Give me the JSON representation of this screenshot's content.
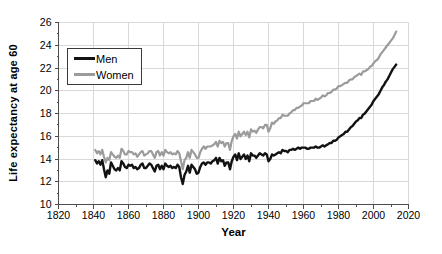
{
  "chart_data": {
    "type": "line",
    "title": "",
    "xlabel": "Year",
    "ylabel": "Life expectancy at age 60",
    "xlim": [
      1820,
      2020
    ],
    "ylim": [
      10,
      26
    ],
    "xticks": [
      1820,
      1840,
      1860,
      1880,
      1900,
      1920,
      1940,
      1960,
      1980,
      2000,
      2020
    ],
    "xminor_ticks": [
      1830,
      1850,
      1870,
      1890,
      1910,
      1930,
      1950,
      1970,
      1990,
      2010
    ],
    "yticks": [
      10,
      12,
      14,
      16,
      18,
      20,
      22,
      24,
      26
    ],
    "yminor_ticks": [
      11,
      13,
      15,
      17,
      19,
      21,
      23,
      25
    ],
    "grid": true,
    "legend_position": "upper-left-inside",
    "x_start": 1841,
    "x_end": 2013,
    "axis_color": "#4d4d4d",
    "grid_color": "#d9d9d9",
    "tick_label_color": "#000000",
    "series": [
      {
        "name": "Men",
        "color": "#121212",
        "values": [
          13.9,
          13.6,
          13.8,
          13.5,
          13.9,
          13.1,
          12.4,
          13.0,
          12.7,
          13.7,
          13.4,
          13.1,
          13.0,
          13.2,
          13.0,
          13.8,
          13.6,
          13.3,
          13.2,
          13.5,
          13.4,
          13.5,
          13.2,
          13.3,
          13.1,
          13.2,
          13.5,
          13.6,
          13.2,
          13.2,
          13.4,
          13.6,
          13.5,
          13.2,
          12.9,
          13.4,
          13.5,
          13.1,
          13.4,
          13.1,
          13.6,
          13.4,
          13.3,
          13.4,
          13.2,
          13.3,
          13.2,
          13.5,
          13.3,
          12.4,
          11.8,
          12.6,
          12.9,
          13.4,
          12.8,
          13.5,
          13.3,
          13.1,
          12.7,
          12.8,
          13.3,
          13.6,
          13.7,
          13.5,
          13.7,
          13.7,
          13.6,
          13.8,
          13.9,
          14.1,
          13.6,
          14.1,
          13.8,
          13.9,
          13.4,
          13.7,
          13.7,
          13.1,
          13.8,
          14.2,
          14.4,
          13.9,
          14.5,
          14.0,
          14.2,
          14.4,
          14.0,
          14.3,
          13.8,
          14.5,
          14.3,
          14.3,
          14.1,
          14.3,
          14.5,
          14.4,
          14.3,
          14.5,
          14.4,
          13.8,
          14.0,
          14.4,
          14.3,
          14.4,
          14.5,
          14.6,
          14.5,
          14.8,
          14.7,
          14.7,
          14.6,
          14.8,
          14.8,
          14.9,
          14.8,
          14.9,
          15.0,
          14.9,
          15.0,
          15.0,
          15.0,
          14.9,
          14.9,
          15.0,
          15.0,
          15.0,
          15.1,
          15.0,
          15.0,
          15.1,
          15.2,
          15.1,
          15.2,
          15.3,
          15.4,
          15.4,
          15.6,
          15.6,
          15.7,
          15.9,
          16.0,
          16.1,
          16.2,
          16.4,
          16.4,
          16.6,
          16.8,
          16.9,
          17.1,
          17.3,
          17.4,
          17.6,
          17.6,
          17.9,
          18.0,
          18.2,
          18.4,
          18.6,
          18.8,
          19.1,
          19.3,
          19.5,
          19.7,
          20.0,
          20.3,
          20.5,
          20.8,
          21.0,
          21.3,
          21.6,
          21.9,
          22.1,
          22.3
        ]
      },
      {
        "name": "Women",
        "color": "#9b9b9b",
        "values": [
          14.8,
          14.5,
          14.7,
          14.4,
          14.8,
          14.2,
          13.7,
          14.1,
          13.9,
          14.6,
          14.4,
          14.2,
          14.1,
          14.3,
          14.1,
          14.9,
          14.7,
          14.4,
          14.4,
          14.7,
          14.6,
          14.6,
          14.4,
          14.5,
          14.2,
          14.4,
          14.6,
          14.7,
          14.3,
          14.4,
          14.5,
          14.7,
          14.7,
          14.4,
          14.1,
          14.6,
          14.7,
          14.3,
          14.6,
          14.3,
          14.8,
          14.6,
          14.5,
          14.6,
          14.4,
          14.5,
          14.4,
          14.7,
          14.5,
          13.8,
          13.1,
          13.9,
          14.1,
          14.6,
          14.1,
          14.8,
          14.6,
          14.4,
          14.1,
          14.1,
          14.6,
          14.9,
          15.1,
          14.9,
          15.1,
          15.1,
          15.1,
          15.2,
          15.3,
          15.5,
          15.1,
          15.6,
          15.4,
          15.5,
          15.1,
          15.4,
          15.4,
          14.8,
          15.6,
          16.0,
          16.2,
          15.8,
          16.4,
          16.0,
          16.2,
          16.4,
          16.1,
          16.4,
          15.9,
          16.6,
          16.4,
          16.5,
          16.3,
          16.6,
          16.8,
          16.8,
          16.7,
          17.0,
          17.0,
          16.4,
          16.7,
          17.2,
          17.1,
          17.3,
          17.4,
          17.6,
          17.6,
          17.9,
          17.8,
          17.8,
          17.8,
          18.0,
          18.1,
          18.3,
          18.3,
          18.5,
          18.5,
          18.6,
          18.7,
          18.9,
          18.9,
          18.9,
          18.9,
          19.1,
          19.1,
          19.1,
          19.3,
          19.2,
          19.3,
          19.4,
          19.6,
          19.5,
          19.6,
          19.8,
          19.8,
          19.9,
          20.1,
          20.1,
          20.2,
          20.4,
          20.4,
          20.5,
          20.6,
          20.7,
          20.7,
          20.9,
          21.0,
          21.0,
          21.2,
          21.3,
          21.4,
          21.5,
          21.4,
          21.7,
          21.7,
          21.8,
          21.9,
          22.1,
          22.2,
          22.4,
          22.6,
          22.7,
          22.9,
          23.2,
          23.4,
          23.6,
          23.8,
          24.0,
          24.2,
          24.4,
          24.6,
          24.9,
          25.2
        ]
      }
    ]
  }
}
